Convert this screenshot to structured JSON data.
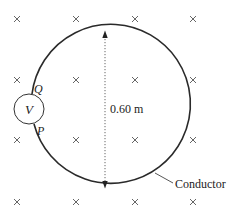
{
  "diagram": {
    "field_symbol": "×",
    "field_grid": {
      "columns_x": [
        17,
        76,
        135,
        193
      ],
      "rows_y": [
        19,
        80,
        140,
        202
      ]
    },
    "loop": {
      "center": [
        105,
        109.5
      ],
      "radius": 79.5,
      "stroke_color": "#2a2a2a"
    },
    "diameter_label": "0.60 m",
    "voltmeter": {
      "label": "V",
      "center": [
        29,
        109
      ],
      "radius": 15
    },
    "terminal_labels": {
      "q": "Q",
      "p": "P"
    },
    "conductor_label": "Conductor"
  }
}
